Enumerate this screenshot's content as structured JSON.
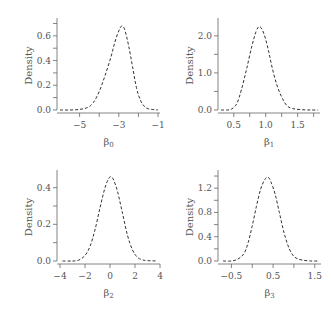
{
  "figure": {
    "width": 331,
    "height": 310,
    "line_color": "#333333",
    "axis_color": "#666666",
    "text_color": "#555555",
    "line_style": "dashed"
  },
  "chart_data": [
    {
      "type": "line",
      "title": "",
      "xlabel": "β0",
      "xlabel_main": "β",
      "xlabel_sub": "0",
      "ylabel": "Density",
      "xlim": [
        -6.0,
        -0.9
      ],
      "ylim": [
        0.0,
        0.72
      ],
      "xticks": [
        -5,
        -4,
        -3,
        -2,
        -1
      ],
      "xtick_labels": [
        "−5",
        "",
        "−3",
        "",
        "−1"
      ],
      "yticks": [
        0.0,
        0.1,
        0.2,
        0.3,
        0.4,
        0.5,
        0.6,
        0.7
      ],
      "ytick_labels": [
        "0.0",
        "",
        "0.2",
        "",
        "0.4",
        "",
        "0.6",
        ""
      ],
      "grid": false,
      "legend": null,
      "series": [
        {
          "name": "posterior density β0",
          "x": [
            -6.0,
            -5.5,
            -5.0,
            -4.6,
            -4.3,
            -4.0,
            -3.7,
            -3.4,
            -3.2,
            -3.0,
            -2.85,
            -2.7,
            -2.5,
            -2.3,
            -2.1,
            -1.9,
            -1.7,
            -1.5,
            -1.2,
            -1.0
          ],
          "y": [
            0.0,
            0.0,
            0.005,
            0.02,
            0.06,
            0.15,
            0.28,
            0.43,
            0.55,
            0.64,
            0.68,
            0.65,
            0.52,
            0.35,
            0.18,
            0.08,
            0.03,
            0.01,
            0.003,
            0.0
          ]
        }
      ],
      "box": {
        "x": 57,
        "y": 18,
        "w": 103,
        "h": 95
      }
    },
    {
      "type": "line",
      "title": "",
      "xlabel": "β1",
      "xlabel_main": "β",
      "xlabel_sub": "1",
      "ylabel": "Density",
      "xlim": [
        0.3,
        1.85
      ],
      "ylim": [
        0.0,
        2.4
      ],
      "xticks": [
        0.5,
        0.75,
        1.0,
        1.25,
        1.5,
        1.75
      ],
      "xtick_labels": [
        "0.5",
        "",
        "1.0",
        "",
        "1.5",
        ""
      ],
      "yticks": [
        0.0,
        0.5,
        1.0,
        1.5,
        2.0
      ],
      "ytick_labels": [
        "0.0",
        "",
        "1.0",
        "",
        "2.0"
      ],
      "grid": false,
      "legend": null,
      "series": [
        {
          "name": "posterior density β1",
          "x": [
            0.3,
            0.4,
            0.47,
            0.55,
            0.62,
            0.7,
            0.78,
            0.85,
            0.9,
            0.95,
            1.0,
            1.05,
            1.1,
            1.17,
            1.25,
            1.33,
            1.42,
            1.55,
            1.7,
            1.82
          ],
          "y": [
            0.0,
            0.0,
            0.03,
            0.18,
            0.55,
            1.1,
            1.7,
            2.12,
            2.25,
            2.15,
            1.9,
            1.55,
            1.15,
            0.7,
            0.35,
            0.12,
            0.04,
            0.01,
            0.0,
            0.0
          ]
        }
      ],
      "box": {
        "x": 218,
        "y": 18,
        "w": 102,
        "h": 95
      }
    },
    {
      "type": "line",
      "title": "",
      "xlabel": "β2",
      "xlabel_main": "β",
      "xlabel_sub": "2",
      "ylabel": "Density",
      "xlim": [
        -4.0,
        4.0
      ],
      "ylim": [
        0.0,
        0.48
      ],
      "xticks": [
        -4,
        -2,
        0,
        2,
        4
      ],
      "xtick_labels": [
        "−4",
        "−2",
        "0",
        "2",
        "4"
      ],
      "yticks": [
        0.0,
        0.1,
        0.2,
        0.3,
        0.4
      ],
      "ytick_labels": [
        "0.0",
        "",
        "0.2",
        "",
        "0.4"
      ],
      "grid": false,
      "legend": null,
      "series": [
        {
          "name": "posterior density β2",
          "x": [
            -3.8,
            -3.0,
            -2.5,
            -2.0,
            -1.6,
            -1.2,
            -0.8,
            -0.4,
            -0.1,
            0.1,
            0.3,
            0.6,
            1.0,
            1.4,
            1.8,
            2.2,
            2.6,
            3.0,
            3.8
          ],
          "y": [
            0.0,
            0.0,
            0.005,
            0.03,
            0.08,
            0.17,
            0.29,
            0.4,
            0.45,
            0.46,
            0.44,
            0.38,
            0.26,
            0.14,
            0.06,
            0.02,
            0.006,
            0.002,
            0.0
          ]
        }
      ],
      "box": {
        "x": 57,
        "y": 170,
        "w": 103,
        "h": 94
      }
    },
    {
      "type": "line",
      "title": "",
      "xlabel": "β3",
      "xlabel_main": "β",
      "xlabel_sub": "3",
      "ylabel": "Density",
      "xlim": [
        -0.75,
        1.65
      ],
      "ylim": [
        0.0,
        1.45
      ],
      "xticks": [
        -0.5,
        0.0,
        0.5,
        1.0,
        1.5
      ],
      "xtick_labels": [
        "−0.5",
        "",
        "0.5",
        "",
        "1.5"
      ],
      "yticks": [
        0.0,
        0.2,
        0.4,
        0.6,
        0.8,
        1.0,
        1.2,
        1.4
      ],
      "ytick_labels": [
        "0.0",
        "",
        "0.4",
        "",
        "0.8",
        "",
        "1.2",
        ""
      ],
      "grid": false,
      "legend": null,
      "series": [
        {
          "name": "posterior density β3",
          "x": [
            -0.7,
            -0.5,
            -0.35,
            -0.2,
            -0.1,
            0.0,
            0.1,
            0.2,
            0.3,
            0.38,
            0.45,
            0.55,
            0.65,
            0.75,
            0.85,
            0.95,
            1.05,
            1.2,
            1.4,
            1.6
          ],
          "y": [
            0.0,
            0.0,
            0.03,
            0.12,
            0.3,
            0.58,
            0.9,
            1.18,
            1.34,
            1.38,
            1.3,
            1.1,
            0.8,
            0.5,
            0.27,
            0.12,
            0.05,
            0.015,
            0.0,
            0.0
          ]
        }
      ],
      "box": {
        "x": 218,
        "y": 170,
        "w": 103,
        "h": 94
      }
    }
  ]
}
